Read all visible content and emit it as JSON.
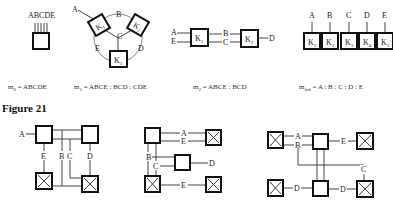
{
  "figure_label": "Figure 21",
  "top_row": {
    "m0": {
      "terminal_labels": "ABCDE",
      "formula": {
        "prefix": "m",
        "sub": "0",
        "rest": " = ABCDE"
      }
    },
    "m1": {
      "nodes": [
        "K1",
        "K2",
        "K3"
      ],
      "edge_labels": [
        "A",
        "B",
        "C",
        "D",
        "E"
      ],
      "formula": {
        "prefix": "m",
        "sub": "1",
        "rest": " = ABCE : BCD : CDE"
      }
    },
    "m2": {
      "nodes": [
        "K1",
        "K2"
      ],
      "edge_labels": [
        "A",
        "E",
        "B",
        "C",
        "D"
      ],
      "formula": {
        "prefix": "m",
        "sub": "2",
        "rest": " = ABCE : BCD"
      }
    },
    "mind": {
      "nodes": [
        "K1",
        "K2",
        "K3",
        "K4",
        "K5"
      ],
      "edge_labels": [
        "A",
        "B",
        "C",
        "D",
        "E"
      ],
      "formula": {
        "prefix": "m",
        "sub": "ind",
        "rest": " = A : B : C : D : E"
      }
    }
  },
  "bottom_row": {
    "left": {
      "edge_labels": [
        "A",
        "E",
        "B",
        "C",
        "D"
      ]
    },
    "middle": {
      "edge_labels": [
        "A",
        "E",
        "B",
        "C",
        "D",
        "E"
      ]
    },
    "right": {
      "edge_labels": [
        "A",
        "B",
        "E",
        "C",
        "D",
        "D"
      ]
    }
  }
}
